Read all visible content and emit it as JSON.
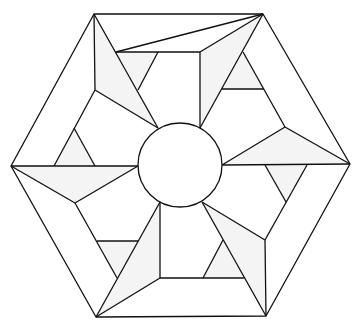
{
  "diagram": {
    "colors": {
      "stroke": "#111111",
      "shade": "#f4f4f4",
      "background": "#ffffff"
    },
    "hexagon": [
      [
        94,
        14
      ],
      [
        263,
        14
      ],
      [
        350,
        164
      ],
      [
        266,
        316
      ],
      [
        96,
        317
      ],
      [
        11,
        166
      ]
    ],
    "circle": {
      "cx": 180,
      "cy": 165,
      "r": 42
    },
    "shaded_polygons": [
      [
        [
          94,
          14
        ],
        [
          95,
          90
        ],
        [
          158,
          128
        ]
      ],
      [
        [
          116,
          52
        ],
        [
          158,
          52
        ],
        [
          138,
          90
        ]
      ],
      [
        [
          263,
          14
        ],
        [
          200,
          52
        ],
        [
          200,
          128
        ]
      ],
      [
        [
          243,
          52
        ],
        [
          222,
          89
        ],
        [
          264,
          89
        ]
      ],
      [
        [
          350,
          164
        ],
        [
          285,
          127
        ],
        [
          222,
          165
        ]
      ],
      [
        [
          265,
          165
        ],
        [
          307,
          165
        ],
        [
          286,
          202
        ]
      ],
      [
        [
          266,
          316
        ],
        [
          265,
          240
        ],
        [
          202,
          202
        ]
      ],
      [
        [
          223,
          240
        ],
        [
          203,
          278
        ],
        [
          244,
          278
        ]
      ],
      [
        [
          96,
          317
        ],
        [
          160,
          278
        ],
        [
          160,
          202
        ]
      ],
      [
        [
          97,
          241
        ],
        [
          138,
          241
        ],
        [
          117,
          278
        ]
      ],
      [
        [
          11,
          166
        ],
        [
          75,
          203
        ],
        [
          138,
          166
        ]
      ],
      [
        [
          54,
          166
        ],
        [
          95,
          166
        ],
        [
          74,
          128
        ]
      ]
    ],
    "lines": [
      [
        [
          94,
          14
        ],
        [
          95,
          90
        ]
      ],
      [
        [
          95,
          90
        ],
        [
          158,
          128
        ]
      ],
      [
        [
          94,
          14
        ],
        [
          158,
          128
        ]
      ],
      [
        [
          116,
          52
        ],
        [
          263,
          14
        ]
      ],
      [
        [
          116,
          52
        ],
        [
          200,
          52
        ]
      ],
      [
        [
          158,
          52
        ],
        [
          138,
          90
        ]
      ],
      [
        [
          200,
          52
        ],
        [
          200,
          128
        ]
      ],
      [
        [
          200,
          52
        ],
        [
          263,
          14
        ]
      ],
      [
        [
          263,
          14
        ],
        [
          200,
          128
        ]
      ],
      [
        [
          222,
          89
        ],
        [
          264,
          89
        ]
      ],
      [
        [
          243,
          52
        ],
        [
          285,
          127
        ]
      ],
      [
        [
          285,
          127
        ],
        [
          350,
          164
        ]
      ],
      [
        [
          285,
          127
        ],
        [
          222,
          165
        ]
      ],
      [
        [
          222,
          165
        ],
        [
          350,
          164
        ]
      ],
      [
        [
          265,
          165
        ],
        [
          286,
          202
        ]
      ],
      [
        [
          307,
          165
        ],
        [
          265,
          240
        ]
      ],
      [
        [
          202,
          202
        ],
        [
          265,
          240
        ]
      ],
      [
        [
          202,
          202
        ],
        [
          266,
          316
        ]
      ],
      [
        [
          265,
          240
        ],
        [
          266,
          316
        ]
      ],
      [
        [
          223,
          240
        ],
        [
          203,
          278
        ]
      ],
      [
        [
          160,
          278
        ],
        [
          244,
          278
        ]
      ],
      [
        [
          160,
          202
        ],
        [
          160,
          278
        ]
      ],
      [
        [
          160,
          278
        ],
        [
          96,
          317
        ]
      ],
      [
        [
          160,
          202
        ],
        [
          96,
          317
        ]
      ],
      [
        [
          97,
          241
        ],
        [
          138,
          241
        ]
      ],
      [
        [
          75,
          203
        ],
        [
          117,
          278
        ]
      ],
      [
        [
          11,
          166
        ],
        [
          138,
          166
        ]
      ],
      [
        [
          11,
          166
        ],
        [
          75,
          203
        ]
      ],
      [
        [
          75,
          203
        ],
        [
          138,
          166
        ]
      ],
      [
        [
          95,
          90
        ],
        [
          54,
          166
        ]
      ],
      [
        [
          74,
          128
        ],
        [
          95,
          166
        ]
      ]
    ]
  }
}
